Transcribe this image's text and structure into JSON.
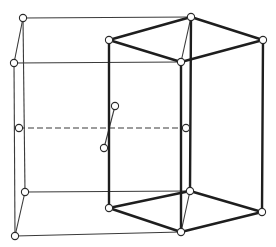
{
  "diagram": {
    "title": "",
    "colors": {
      "line": "#1e1e1e",
      "thin_line": "#3a3a3a",
      "atom_fill": "#ffffff",
      "background": "#ffffff"
    },
    "nodes": {
      "cube_top_back_left": [
        23,
        18
      ],
      "cube_top_front_left": [
        14,
        63
      ],
      "hex_top_left": [
        109,
        40
      ],
      "hex_top_back": [
        191,
        17
      ],
      "hex_top_right": [
        263,
        40
      ],
      "hex_top_front": [
        181,
        62
      ],
      "cube_mid_left": [
        19,
        128
      ],
      "cube_mid_right": [
        186,
        128
      ],
      "inner_atom_upper": [
        115,
        106
      ],
      "inner_atom_lower": [
        104,
        148
      ],
      "cube_bottom_back_left": [
        25,
        192
      ],
      "cube_bottom_front_left": [
        15,
        236
      ],
      "hex_bottom_left": [
        109,
        208
      ],
      "hex_bottom_back": [
        190,
        191
      ],
      "hex_bottom_right": [
        262,
        212
      ],
      "hex_bottom_front": [
        181,
        232
      ]
    },
    "labels": []
  }
}
